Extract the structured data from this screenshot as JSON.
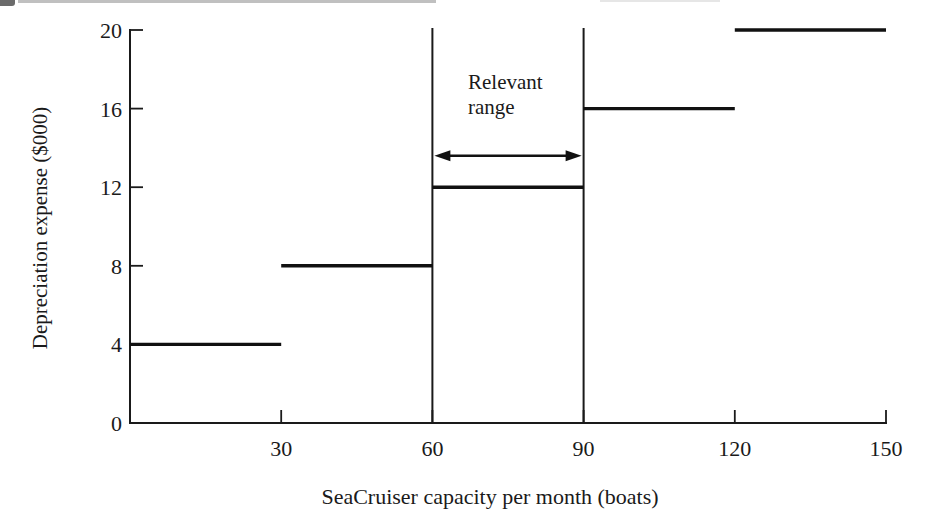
{
  "chart_data": {
    "type": "line",
    "subtype": "step-segments",
    "title": "",
    "xlabel": "SeaCruiser capacity per month (boats)",
    "ylabel": "Depreciation expense ($000)",
    "xlim": [
      0,
      150
    ],
    "ylim": [
      0,
      20
    ],
    "x_ticks": [
      30,
      60,
      90,
      120,
      150
    ],
    "y_ticks": [
      0,
      4,
      8,
      12,
      16,
      20
    ],
    "grid": false,
    "legend": false,
    "line_color": "#1a1a1a",
    "background_color": "#ffffff",
    "segments": [
      {
        "x_start": 0,
        "x_end": 30,
        "y": 4
      },
      {
        "x_start": 30,
        "x_end": 60,
        "y": 8
      },
      {
        "x_start": 60,
        "x_end": 90,
        "y": 12
      },
      {
        "x_start": 90,
        "x_end": 120,
        "y": 16
      },
      {
        "x_start": 120,
        "x_end": 150,
        "y": 20
      }
    ],
    "relevant_range": {
      "label": "Relevant\nrange",
      "x_start": 60,
      "x_end": 90,
      "arrow_y": 13.6
    }
  }
}
